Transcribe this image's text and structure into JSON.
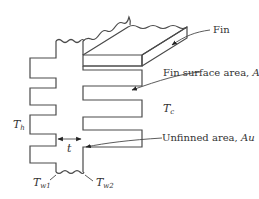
{
  "diagram": {
    "type": "finned-wall-cross-section",
    "colors": {
      "stroke": "#4a4a4a",
      "text": "#333333",
      "background": "#ffffff"
    },
    "labels": {
      "fin": "Fin",
      "fin_surface_area": "Fin surface area, ",
      "fin_surface_symbol": "A",
      "fin_surface_sub": "f",
      "unfinned_area": "Unfinned area, ",
      "unfinned_symbol": "Au",
      "t_c": "T",
      "t_c_sub": "c",
      "t_h": "T",
      "t_h_sub": "h",
      "thickness": "t",
      "t_w1": "T",
      "t_w1_sub": "w1",
      "t_w2": "T",
      "t_w2_sub": "w2"
    }
  }
}
